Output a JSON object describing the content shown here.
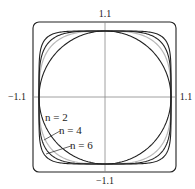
{
  "chart_data": {
    "type": "line",
    "title": "",
    "xlabel": "",
    "ylabel": "",
    "xlim": [
      -1.1,
      1.1
    ],
    "ylim": [
      -1.1,
      1.1
    ],
    "grid": false,
    "tick_labels": {
      "top": "1.1",
      "bottom": "−1.1",
      "left": "−1.1",
      "right": "1.1"
    },
    "series": [
      {
        "name": "n = 2",
        "n": 2,
        "color": "#222222"
      },
      {
        "name": "n = 4",
        "n": 4,
        "color": "#222222"
      },
      {
        "name": "n = 6",
        "n": 6,
        "color": "#222222"
      },
      {
        "name": "light curve",
        "n": 3,
        "color": "#b8b8b8"
      }
    ],
    "annotations": [
      {
        "text": "n = 2",
        "target": "n = 2"
      },
      {
        "text": "n = 4",
        "target": "n = 4"
      },
      {
        "text": "n = 6",
        "target": "n = 6"
      }
    ]
  }
}
